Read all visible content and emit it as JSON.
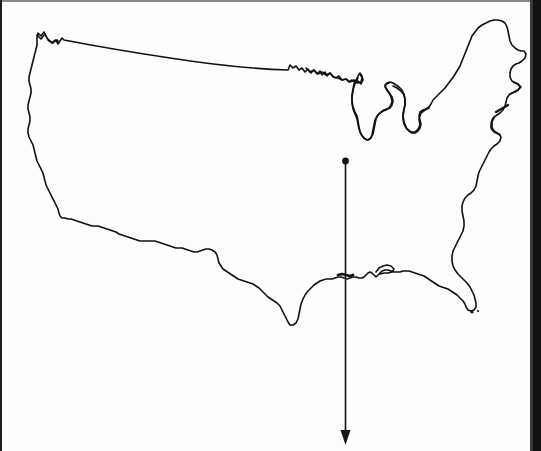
{
  "figure": {
    "title": "Outline map of the contiguous United States",
    "style": "black line drawing on white background",
    "background_color": "#fdfdfd",
    "line_color": "#111111",
    "line_width_px": 1.6,
    "width_px": 541,
    "height_px": 451
  },
  "scan_artifacts": {
    "left_edge_label": "dark scan edge line",
    "right_edge_label": "dark scan gutter band",
    "top_edge_label": "faint dark scan edge"
  },
  "annotation": {
    "type": "arrow",
    "label": "downward vertical arrow",
    "color": "#141414",
    "shaft_width_px": 1.6,
    "origin_dot": {
      "label": "filled origin dot",
      "x": 345.5,
      "y": 161,
      "radius_px": 3.4
    },
    "start": {
      "x": 345.5,
      "y": 161
    },
    "end": {
      "x": 345.5,
      "y": 445
    },
    "head": {
      "label": "solid triangular arrowhead",
      "tip_x": 345.5,
      "tip_y": 445,
      "half_width_px": 5,
      "length_px": 15
    },
    "crosses_coastline_at_y": 277
  },
  "chart_data": {
    "type": "map",
    "regions": [
      "west-coast",
      "northern-border",
      "great-lakes",
      "northeast-maine",
      "atlantic-coast",
      "florida-peninsula",
      "gulf-coast",
      "texas",
      "southwest-border"
    ],
    "features": [
      {
        "name": "pacific-northwest-corner",
        "x": 45,
        "y": 33
      },
      {
        "name": "great-lakes-michigan",
        "x": 360,
        "y": 100
      },
      {
        "name": "maine-northeast-tip",
        "x": 505,
        "y": 20
      },
      {
        "name": "florida-southern-tip",
        "x": 475,
        "y": 308
      },
      {
        "name": "texas-southern-tip",
        "x": 285,
        "y": 325
      },
      {
        "name": "southern-california-corner",
        "x": 60,
        "y": 218
      }
    ],
    "annotations": [
      {
        "kind": "arrow",
        "direction": "down",
        "x": 345.5,
        "y_start": 161,
        "y_end": 445
      }
    ]
  }
}
